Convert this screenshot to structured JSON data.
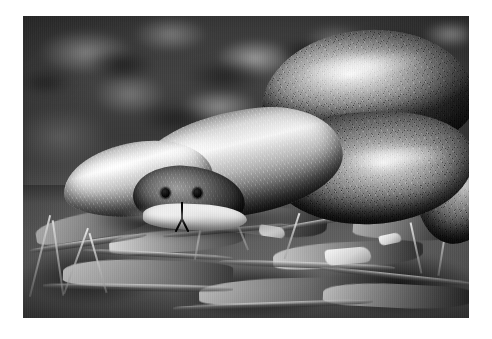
{
  "photo": {
    "subject": "snake",
    "subject_common_name": "brown snake",
    "color_mode": "black-and-white",
    "orientation": "landscape",
    "border_style": "white photographic border",
    "caption": "",
    "alt_text": "Black-and-white photograph of a coiled snake resting on leaf litter with its tongue flicking out"
  },
  "frame": {
    "left": 23,
    "top": 16,
    "width": 446,
    "height": 302,
    "border_color": "#ffffff"
  },
  "palette": {
    "border": "#ffffff",
    "background_dark": "#2a2a2a",
    "background_mid": "#5a5a5a",
    "highlight": "#f2f2f2",
    "shadow": "#121212",
    "ground_mid": "#6b6b6b"
  },
  "regions": [
    {
      "name": "blurred-background",
      "description": "dark out-of-focus bokeh foliage and soil",
      "area": "upper half"
    },
    {
      "name": "snake-head",
      "description": "head with two dark eyes and forked tongue extended downward",
      "area": "center-left"
    },
    {
      "name": "snake-body",
      "description": "smooth overlapping dorsal scales with specular highlights",
      "area": "center"
    },
    {
      "name": "snake-coil",
      "description": "large looping coil with diamond scale pattern",
      "area": "right"
    },
    {
      "name": "ground-litter",
      "description": "dry leaves, twigs, bark and grass stems",
      "area": "lower third"
    }
  ],
  "features": {
    "eyes": 2,
    "tongue": "forked",
    "coils_visible": 3,
    "scale_pattern": "diamond / imbricate"
  }
}
